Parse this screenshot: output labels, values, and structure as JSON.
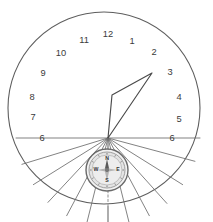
{
  "diagram": {
    "type": "sundial-dial-plate"
  },
  "dial": {
    "center": {
      "x": 108,
      "y": 138
    },
    "outline": {
      "cx": 104,
      "cy": 108,
      "r": 96
    }
  },
  "hour_lines": [
    {
      "label": "6",
      "angle_deg": 270,
      "length": 92,
      "label_x": 42,
      "label_y": 139,
      "is_noon": false
    },
    {
      "label": "7",
      "angle_deg": 253,
      "length": 90,
      "label_x": 33,
      "label_y": 118,
      "is_noon": false
    },
    {
      "label": "8",
      "angle_deg": 238,
      "length": 88,
      "label_x": 32,
      "label_y": 98,
      "is_noon": false
    },
    {
      "label": "9",
      "angle_deg": 223,
      "length": 88,
      "label_x": 43,
      "label_y": 74,
      "is_noon": false
    },
    {
      "label": "10",
      "angle_deg": 208,
      "length": 88,
      "label_x": 61,
      "label_y": 54,
      "is_noon": false
    },
    {
      "label": "11",
      "angle_deg": 194,
      "length": 88,
      "label_x": 84,
      "label_y": 41,
      "is_noon": false
    },
    {
      "label": "12",
      "angle_deg": 180,
      "length": 104,
      "label_x": 108,
      "label_y": 35,
      "is_noon": true
    },
    {
      "label": "1",
      "angle_deg": 166,
      "length": 88,
      "label_x": 132,
      "label_y": 42,
      "is_noon": false
    },
    {
      "label": "2",
      "angle_deg": 152,
      "length": 88,
      "label_x": 154,
      "label_y": 53,
      "is_noon": false
    },
    {
      "label": "3",
      "angle_deg": 138,
      "length": 88,
      "label_x": 170,
      "label_y": 73,
      "is_noon": false
    },
    {
      "label": "4",
      "angle_deg": 122,
      "length": 88,
      "label_x": 179,
      "label_y": 98,
      "is_noon": false
    },
    {
      "label": "5",
      "angle_deg": 105,
      "length": 90,
      "label_x": 179,
      "label_y": 120,
      "is_noon": false
    },
    {
      "label": "6",
      "angle_deg": 90,
      "length": 92,
      "label_x": 172,
      "label_y": 139,
      "is_noon": false
    }
  ],
  "gnomon": {
    "name": "gnomon-style-triangle",
    "points": "108,138 152,73 112,95 108,138"
  },
  "compass": {
    "name": "compass-rose",
    "cx": 107,
    "cy": 170,
    "r_outer": 21,
    "r_inner": 18,
    "r_face": 15,
    "cardinals": [
      {
        "label": "N",
        "x": 107,
        "y": 159
      },
      {
        "label": "S",
        "x": 107,
        "y": 181
      },
      {
        "label": "W",
        "x": 96,
        "y": 170
      },
      {
        "label": "E",
        "x": 118,
        "y": 170
      }
    ]
  },
  "colors": {
    "outline": "#5e5e5e",
    "hour_line": "#6b6b6b",
    "gnomon": "#4a4a4a",
    "label_text": "#3a3a3a",
    "compass_rim": "#6a6a6a",
    "background": "#ffffff"
  }
}
